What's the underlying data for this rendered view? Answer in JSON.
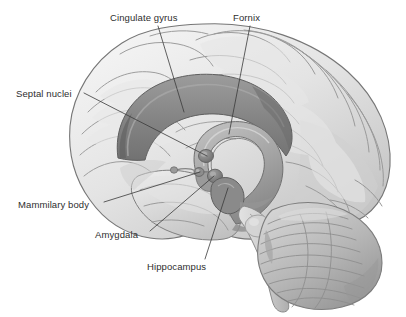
{
  "figure": {
    "view": "mid-sagittal lateral illustration",
    "background_color": "#ffffff",
    "text_color": "#2e2e2e",
    "leader_line_color": "#3a3a3a",
    "palette": {
      "cortex_light": "#ededed",
      "cortex_mid": "#d2d2d2",
      "cortex_shadow": "#b0b0b0",
      "sulcus_line": "#9a9a9a",
      "limbic_band": "#8e8e8e",
      "limbic_band_dark": "#6f6f6f",
      "fornix": "#a5a5a5",
      "nucleus_dark": "#7a7a7a",
      "outline": "#6a6a6a",
      "cerebellum": "#b8b8b8",
      "brainstem": "#cfcfcf"
    }
  },
  "labels": [
    {
      "id": "cingulate-gyrus",
      "text": "Cingulate gyrus",
      "x": 110,
      "y": 12,
      "leader": {
        "x1": 158,
        "y1": 26,
        "x2": 184,
        "y2": 112
      }
    },
    {
      "id": "fornix",
      "text": "Fornix",
      "x": 233,
      "y": 12,
      "leader": {
        "x1": 250,
        "y1": 26,
        "x2": 229,
        "y2": 134
      }
    },
    {
      "id": "septal-nuclei",
      "text": "Septal nuclei",
      "x": 16,
      "y": 88,
      "leader": {
        "x1": 84,
        "y1": 93,
        "x2": 207,
        "y2": 156
      }
    },
    {
      "id": "mammilary-body",
      "text": "Mammilary body",
      "x": 18,
      "y": 199,
      "leader": {
        "x1": 104,
        "y1": 202,
        "x2": 200,
        "y2": 172
      }
    },
    {
      "id": "amygdala",
      "text": "Amygdala",
      "x": 95,
      "y": 229,
      "leader": {
        "x1": 150,
        "y1": 231,
        "x2": 214,
        "y2": 176
      }
    },
    {
      "id": "hippocampus",
      "text": "Hippocampus",
      "x": 147,
      "y": 261,
      "leader": {
        "x1": 205,
        "y1": 259,
        "x2": 228,
        "y2": 188
      }
    }
  ],
  "structures": [
    {
      "id": "cerebral-cortex",
      "name": "Cerebral cortex"
    },
    {
      "id": "cingulate-gyrus-band",
      "name": "Cingulate gyrus band"
    },
    {
      "id": "fornix-arc",
      "name": "Fornix arc"
    },
    {
      "id": "septal-nuclei-mass",
      "name": "Septal nuclei"
    },
    {
      "id": "mammillary-body-nub",
      "name": "Mammillary body"
    },
    {
      "id": "amygdala-mass",
      "name": "Amygdala"
    },
    {
      "id": "hippocampus-mass",
      "name": "Hippocampus"
    },
    {
      "id": "cerebellum",
      "name": "Cerebellum"
    },
    {
      "id": "brainstem",
      "name": "Brainstem"
    }
  ]
}
